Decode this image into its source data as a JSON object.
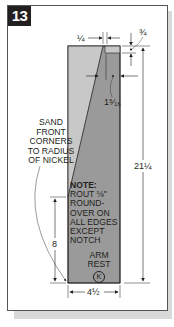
{
  "figure": {
    "number": "13",
    "part_name_line1": "ARM",
    "part_name_line2": "REST",
    "part_letter": "K"
  },
  "annotations": {
    "sand_line1": "SAND",
    "sand_line2": "FRONT",
    "sand_line3": "CORNERS",
    "sand_line4": "TO RADIUS",
    "sand_line5": "OF NICKEL",
    "note_title": "NOTE:",
    "note_line1": "ROUT ⅛\"",
    "note_line2": "ROUND-",
    "note_line3": "OVER ON",
    "note_line4": "ALL EDGES",
    "note_line5": "EXCEPT",
    "note_line6": "NOTCH"
  },
  "dimensions": {
    "top_offset": "¼",
    "notch_depth": "¾",
    "notch_width": "1⁵⁄₁₆",
    "overall_length": "21¼",
    "taper_height": "8",
    "width": "4½"
  },
  "colors": {
    "board_dark": "#9a9a9a",
    "board_light": "#c8c8c8",
    "ink": "#231f20",
    "badge": "#231f20"
  }
}
